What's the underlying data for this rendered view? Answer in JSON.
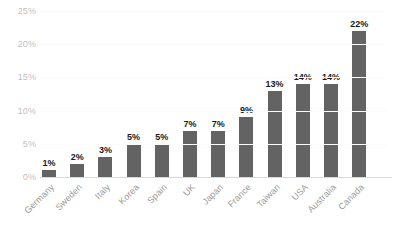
{
  "chart_data": {
    "type": "bar",
    "title": "",
    "subtitle": "",
    "xlabel": "",
    "ylabel": "",
    "ylim": [
      0,
      25
    ],
    "grid": true,
    "legend": false,
    "legend_position": "none",
    "bar_color": "#636363",
    "tick_label_color": "#bfbfbf",
    "value_label_color": "#1a1a1a",
    "background_color": "#ffffff",
    "y_ticks": [
      "0%",
      "5%",
      "10%",
      "15%",
      "20%",
      "25%"
    ],
    "y_tick_values": [
      0,
      5,
      10,
      15,
      20,
      25
    ],
    "categories": [
      "Germany",
      "Sweden",
      "Italy",
      "Korea",
      "Spain",
      "UK",
      "Japan",
      "France",
      "Taiwan",
      "USA",
      "Australia",
      "Canada"
    ],
    "values": [
      1,
      2,
      3,
      5,
      5,
      7,
      7,
      9,
      13,
      14,
      14,
      22
    ],
    "data_labels": [
      "1%",
      "2%",
      "3%",
      "5%",
      "5%",
      "7%",
      "7%",
      "9%",
      "13%",
      "14%",
      "14%",
      "22%"
    ]
  }
}
